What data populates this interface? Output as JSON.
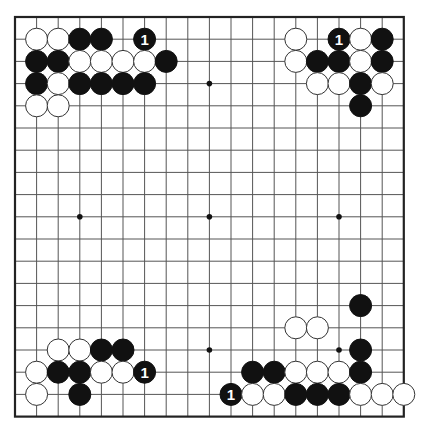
{
  "board": {
    "size": 19,
    "origin_x": 15,
    "origin_y": 17,
    "spacing_x": 21.6,
    "spacing_y": 22.2,
    "stone_radius": 11,
    "colors": {
      "black": "#111111",
      "white": "#ffffff",
      "line": "#555555",
      "border": "#222222"
    },
    "star_points": [
      [
        4,
        4
      ],
      [
        10,
        4
      ],
      [
        16,
        4
      ],
      [
        4,
        10
      ],
      [
        10,
        10
      ],
      [
        16,
        10
      ],
      [
        4,
        16
      ],
      [
        10,
        16
      ],
      [
        16,
        16
      ]
    ]
  },
  "stones": [
    {
      "col": 2,
      "row": 2,
      "color": "white"
    },
    {
      "col": 3,
      "row": 2,
      "color": "white"
    },
    {
      "col": 4,
      "row": 2,
      "color": "black"
    },
    {
      "col": 5,
      "row": 2,
      "color": "black"
    },
    {
      "col": 7,
      "row": 2,
      "color": "black",
      "label": "1"
    },
    {
      "col": 2,
      "row": 3,
      "color": "black"
    },
    {
      "col": 3,
      "row": 3,
      "color": "black"
    },
    {
      "col": 4,
      "row": 3,
      "color": "white"
    },
    {
      "col": 5,
      "row": 3,
      "color": "white"
    },
    {
      "col": 6,
      "row": 3,
      "color": "white"
    },
    {
      "col": 7,
      "row": 3,
      "color": "white"
    },
    {
      "col": 8,
      "row": 3,
      "color": "black"
    },
    {
      "col": 2,
      "row": 4,
      "color": "black"
    },
    {
      "col": 3,
      "row": 4,
      "color": "white"
    },
    {
      "col": 4,
      "row": 4,
      "color": "black"
    },
    {
      "col": 5,
      "row": 4,
      "color": "black"
    },
    {
      "col": 6,
      "row": 4,
      "color": "black"
    },
    {
      "col": 7,
      "row": 4,
      "color": "black"
    },
    {
      "col": 2,
      "row": 5,
      "color": "white"
    },
    {
      "col": 3,
      "row": 5,
      "color": "white"
    },
    {
      "col": 14,
      "row": 2,
      "color": "white"
    },
    {
      "col": 16,
      "row": 2,
      "color": "black",
      "label": "1"
    },
    {
      "col": 17,
      "row": 2,
      "color": "white"
    },
    {
      "col": 18,
      "row": 2,
      "color": "black"
    },
    {
      "col": 14,
      "row": 3,
      "color": "white"
    },
    {
      "col": 15,
      "row": 3,
      "color": "black"
    },
    {
      "col": 16,
      "row": 3,
      "color": "black"
    },
    {
      "col": 17,
      "row": 3,
      "color": "white"
    },
    {
      "col": 18,
      "row": 3,
      "color": "black"
    },
    {
      "col": 15,
      "row": 4,
      "color": "white"
    },
    {
      "col": 16,
      "row": 4,
      "color": "white"
    },
    {
      "col": 17,
      "row": 4,
      "color": "black"
    },
    {
      "col": 18,
      "row": 4,
      "color": "white"
    },
    {
      "col": 17,
      "row": 5,
      "color": "black"
    },
    {
      "col": 3,
      "row": 16,
      "color": "white"
    },
    {
      "col": 4,
      "row": 16,
      "color": "white"
    },
    {
      "col": 5,
      "row": 16,
      "color": "black"
    },
    {
      "col": 6,
      "row": 16,
      "color": "black"
    },
    {
      "col": 2,
      "row": 17,
      "color": "white"
    },
    {
      "col": 3,
      "row": 17,
      "color": "black"
    },
    {
      "col": 4,
      "row": 17,
      "color": "black"
    },
    {
      "col": 5,
      "row": 17,
      "color": "white"
    },
    {
      "col": 6,
      "row": 17,
      "color": "white"
    },
    {
      "col": 7,
      "row": 17,
      "color": "black",
      "label": "1"
    },
    {
      "col": 2,
      "row": 18,
      "color": "white"
    },
    {
      "col": 4,
      "row": 18,
      "color": "black"
    },
    {
      "col": 17,
      "row": 14,
      "color": "black"
    },
    {
      "col": 14,
      "row": 15,
      "color": "white"
    },
    {
      "col": 15,
      "row": 15,
      "color": "white"
    },
    {
      "col": 17,
      "row": 16,
      "color": "black"
    },
    {
      "col": 12,
      "row": 17,
      "color": "black"
    },
    {
      "col": 13,
      "row": 17,
      "color": "black"
    },
    {
      "col": 14,
      "row": 17,
      "color": "white"
    },
    {
      "col": 15,
      "row": 17,
      "color": "white"
    },
    {
      "col": 16,
      "row": 17,
      "color": "white"
    },
    {
      "col": 17,
      "row": 17,
      "color": "black"
    },
    {
      "col": 11,
      "row": 18,
      "color": "black",
      "label": "1"
    },
    {
      "col": 12,
      "row": 18,
      "color": "white"
    },
    {
      "col": 13,
      "row": 18,
      "color": "white"
    },
    {
      "col": 14,
      "row": 18,
      "color": "black"
    },
    {
      "col": 15,
      "row": 18,
      "color": "black"
    },
    {
      "col": 16,
      "row": 18,
      "color": "black"
    },
    {
      "col": 17,
      "row": 18,
      "color": "white"
    },
    {
      "col": 18,
      "row": 18,
      "color": "white"
    },
    {
      "col": 19,
      "row": 18,
      "color": "white"
    }
  ]
}
